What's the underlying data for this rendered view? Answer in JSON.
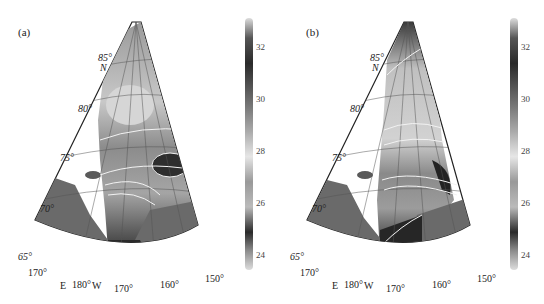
{
  "figure": {
    "panels": [
      {
        "label": "(a)",
        "lat_labels": [
          "85°",
          "N",
          "80°",
          "75°",
          "70°",
          "65°"
        ],
        "lon_labels": [
          "170°",
          "E",
          "180°",
          "W",
          "170°",
          "160°",
          "150°"
        ],
        "contour_labels": [
          "28",
          "27",
          "25",
          "26",
          "25",
          "25",
          "28",
          "28",
          "26",
          "30",
          "30",
          "31",
          "32"
        ],
        "colorbar": {
          "ticks": [
            "32",
            "30",
            "28",
            "26",
            "24"
          ],
          "min": 23,
          "max": 33
        }
      },
      {
        "label": "(b)",
        "lat_labels": [
          "85°",
          "N",
          "80°",
          "75°",
          "70°",
          "65°"
        ],
        "lon_labels": [
          "170°",
          "E",
          "180°",
          "W",
          "170°",
          "160°",
          "150°"
        ],
        "contour_labels": [
          "30",
          "27",
          "28",
          "28",
          "26",
          "29",
          "30",
          "31",
          "32",
          "32"
        ],
        "colorbar": {
          "ticks": [
            "32",
            "30",
            "28",
            "26",
            "24"
          ],
          "min": 23,
          "max": 33
        }
      }
    ],
    "colors": {
      "land": "#6a6a6a",
      "ocean_nodata": "#ffffff",
      "contour": "#f2f2f2",
      "grid": "#555555"
    }
  }
}
